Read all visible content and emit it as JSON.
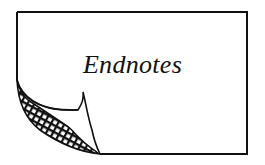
{
  "card": {
    "title": "Endnotes",
    "icon": "curled-page-corner",
    "colors": {
      "ink": "#111111",
      "paper": "#ffffff"
    }
  }
}
